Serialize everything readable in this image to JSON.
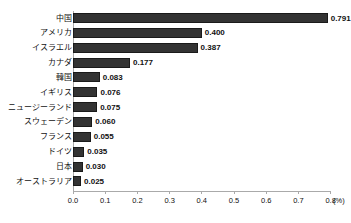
{
  "chart_data": {
    "type": "bar",
    "orientation": "horizontal",
    "title": "",
    "xlabel": "(%)",
    "ylabel": "",
    "categories": [
      "中国",
      "アメリカ",
      "イスラエル",
      "カナダ",
      "韓国",
      "イギリス",
      "ニュージーランド",
      "スウェーデン",
      "フランス",
      "ドイツ",
      "日本",
      "オーストラリア"
    ],
    "values": [
      0.791,
      0.4,
      0.387,
      0.177,
      0.083,
      0.076,
      0.075,
      0.06,
      0.055,
      0.035,
      0.03,
      0.025
    ],
    "value_labels": [
      "0.791",
      "0.400",
      "0.387",
      "0.177",
      "0.083",
      "0.076",
      "0.075",
      "0.060",
      "0.055",
      "0.035",
      "0.030",
      "0.025"
    ],
    "xlim": [
      0.0,
      0.8
    ],
    "xticks": [
      0.0,
      0.1,
      0.2,
      0.3,
      0.4,
      0.5,
      0.6,
      0.7,
      0.8
    ],
    "xtick_labels": [
      "0.0",
      "0.1",
      "0.2",
      "0.3",
      "0.4",
      "0.5",
      "0.6",
      "0.7",
      "0.8"
    ],
    "unit": "(%)",
    "grid": false,
    "legend": null,
    "bar_color": "#333333",
    "axis_color": "#aaaaaa",
    "text_color": "#111111",
    "background": "#ffffff"
  }
}
